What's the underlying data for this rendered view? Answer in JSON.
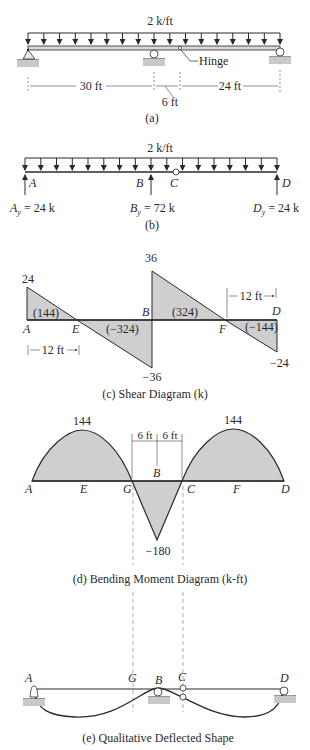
{
  "figure_a": {
    "load_label": "2 k/ft",
    "hinge_label": "Hinge",
    "dim_ab": "30 ft",
    "dim_bc": "6 ft",
    "dim_cd": "24 ft",
    "caption": "(a)"
  },
  "figure_b": {
    "load_label": "2 k/ft",
    "point_a": "A",
    "point_b": "B",
    "point_c": "C",
    "point_d": "D",
    "reaction_a": "A",
    "reaction_a_sub": "y",
    "reaction_a_val": " = 24 k",
    "reaction_b": "B",
    "reaction_b_sub": "y",
    "reaction_b_val": " = 72 k",
    "reaction_d": "D",
    "reaction_d_sub": "y",
    "reaction_d_val": " = 24 k",
    "caption": "(b)"
  },
  "figure_c": {
    "value_a": "24",
    "value_b_top": "36",
    "value_b_bottom": "−36",
    "value_d": "−24",
    "area_ae": "(144)",
    "area_eb": "(−324)",
    "area_bf": "(324)",
    "area_fd": "(−144)",
    "point_a": "A",
    "point_e": "E",
    "point_b": "B",
    "point_f": "F",
    "point_d": "D",
    "dim_ae": "12 ft",
    "dim_fd": "12 ft",
    "caption": "(c) Shear Diagram (k)"
  },
  "figure_d": {
    "peak_left": "144",
    "peak_right": "144",
    "min_b": "−180",
    "dim_gb": "6 ft",
    "dim_bc": "6 ft",
    "point_a": "A",
    "point_e": "E",
    "point_g": "G",
    "point_b": "B",
    "point_c": "C",
    "point_f": "F",
    "point_d": "D",
    "caption": "(d) Bending Moment Diagram (k-ft)"
  },
  "figure_e": {
    "point_a": "A",
    "point_g": "G",
    "point_b": "B",
    "point_c": "C",
    "point_d": "D",
    "caption": "(e) Qualitative Deflected Shape"
  },
  "colors": {
    "line": "#2a2a2a",
    "fill": "#cfcfcf",
    "ground": "#c8c8c8",
    "dash": "#8a8a8a"
  }
}
